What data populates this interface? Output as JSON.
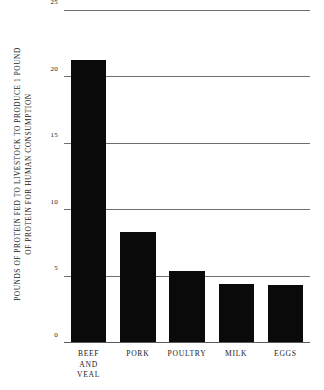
{
  "chart_data": {
    "type": "bar",
    "title": "",
    "subtitle": "",
    "xlabel": "",
    "ylabel": "POUNDS OF PROTEIN FED TO LIVESTOCK TO PRODUCE 1 POUND OF PROTEIN FOR HUMAN CONSUMPTION",
    "ylabel_lines": [
      "POUNDS OF PROTEIN FED TO LIVESTOCK TO PRODUCE 1 POUND",
      "OF PROTEIN FOR HUMAN CONSUMPTION"
    ],
    "categories": [
      "BEEF AND VEAL",
      "PORK",
      "POULTRY",
      "MILK",
      "EGGS"
    ],
    "category_label_lines": [
      [
        "BEEF",
        "AND",
        "VEAL"
      ],
      [
        "PORK"
      ],
      [
        "POULTRY"
      ],
      [
        "MILK"
      ],
      [
        "EGGS"
      ]
    ],
    "values": [
      21.3,
      8.3,
      5.4,
      4.4,
      4.3
    ],
    "ylim": [
      0,
      25
    ],
    "yticks": [
      0,
      5,
      10,
      15,
      20,
      25
    ],
    "ytick_labels": [
      "0",
      "5",
      "10",
      "15",
      "20",
      "25"
    ],
    "grid": true,
    "grid_axis": "y",
    "legend": false,
    "legend_position": "none",
    "bar_color": "#0a0a0a",
    "grid_color": "#6f6f6f",
    "background_color": "#ffffff",
    "text_color": "#1a1a1a"
  }
}
